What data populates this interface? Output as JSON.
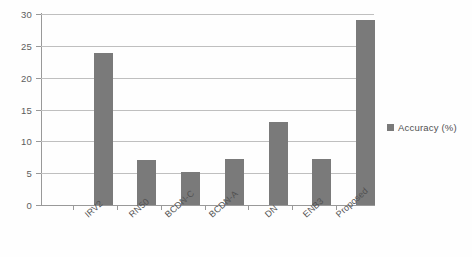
{
  "chart_data": {
    "type": "bar",
    "title": "",
    "subtitle": "",
    "xlabel": "",
    "ylabel": "",
    "categories": [
      "IRV2",
      "RN50",
      "BCDN-C",
      "BCDN-A",
      "DN",
      "ENB3",
      "Proposed"
    ],
    "values": [
      23.8,
      7.0,
      5.2,
      7.3,
      13.0,
      7.3,
      29.0
    ],
    "series": [
      {
        "name": "Accuracy (%)",
        "values": [
          23.8,
          7.0,
          5.2,
          7.3,
          13.0,
          7.3,
          29.0
        ],
        "color": "#6d6d6d"
      }
    ],
    "ylim": [
      0,
      30
    ],
    "yticks": [
      0,
      5,
      10,
      15,
      20,
      25,
      30
    ],
    "ytick_labels": [
      "0",
      "5",
      "10",
      "15",
      "20",
      "25",
      "30"
    ],
    "grid": true,
    "grid_axis": "y",
    "legend": {
      "position": "right",
      "entries": [
        {
          "label": "Accuracy (%)",
          "color": "#6d6d6d",
          "marker": "square"
        }
      ]
    },
    "xtick_label_rotation": -42,
    "bar_color": "#6d6d6d",
    "background_color": "#ffffff",
    "axis_color": "#8f8f8f",
    "gridline_color": "#b9b9b9"
  }
}
